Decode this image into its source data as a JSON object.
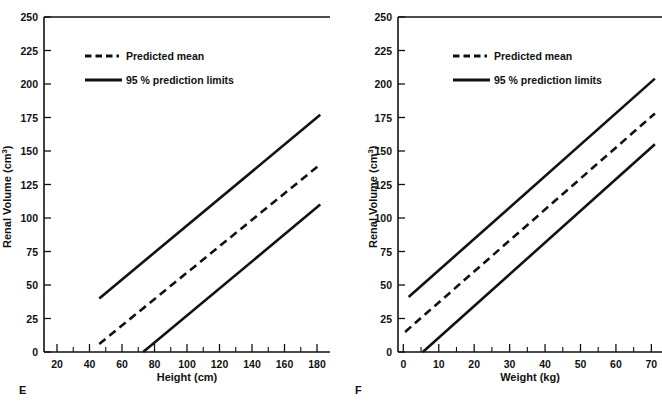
{
  "figure": {
    "background": "#ffffff",
    "ink_color": "#111111",
    "width": 662,
    "height": 415
  },
  "panels": [
    {
      "letter": "E",
      "letter_name": "panel-letter-e",
      "clipped_ylabel": true,
      "chart_data": {
        "type": "line",
        "title": "",
        "xlabel": "Height (cm)",
        "ylabel": "Renal Volume (cm",
        "ylabel_sup": "3",
        "ylabel_tail": ")",
        "xlim": [
          12,
          188
        ],
        "ylim": [
          0,
          250
        ],
        "xticks": [
          20,
          40,
          60,
          80,
          100,
          120,
          140,
          160,
          180
        ],
        "xtick_labels": [
          "20",
          "40",
          "60",
          "80",
          "100",
          "120",
          "140",
          "160",
          "180"
        ],
        "x_minor_step": 10,
        "yticks": [
          0,
          25,
          50,
          75,
          100,
          125,
          150,
          175,
          200,
          225,
          250
        ],
        "ytick_labels": [
          "0",
          "25",
          "50",
          "75",
          "100",
          "125",
          "150",
          "175",
          "200",
          "225",
          "250"
        ],
        "grid": false,
        "legend_position": "top-left",
        "series": [
          {
            "name": "95 % prediction limits upper",
            "style": "solid",
            "x": [
              46,
              182
            ],
            "y": [
              40,
              177
            ]
          },
          {
            "name": "Predicted mean",
            "style": "dashed",
            "x": [
              46,
              182
            ],
            "y": [
              6,
              140
            ]
          },
          {
            "name": "95 % prediction limits lower",
            "style": "solid",
            "x": [
              73,
              182
            ],
            "y": [
              0,
              110
            ]
          }
        ]
      }
    },
    {
      "letter": "F",
      "letter_name": "panel-letter-f",
      "clipped_ylabel": false,
      "chart_data": {
        "type": "line",
        "title": "",
        "xlabel": "Weight (kg)",
        "ylabel": "Renal Volume (cm",
        "ylabel_sup": "3",
        "ylabel_tail": ")",
        "xlim": [
          -1.5,
          73
        ],
        "ylim": [
          0,
          250
        ],
        "xticks": [
          0,
          10,
          20,
          30,
          40,
          50,
          60,
          70
        ],
        "xtick_labels": [
          "0",
          "10",
          "20",
          "30",
          "40",
          "50",
          "60",
          "70"
        ],
        "x_minor_step": 5,
        "yticks": [
          0,
          25,
          50,
          75,
          100,
          125,
          150,
          175,
          200,
          225,
          250
        ],
        "ytick_labels": [
          "0",
          "25",
          "50",
          "75",
          "100",
          "125",
          "150",
          "175",
          "200",
          "225",
          "250"
        ],
        "grid": false,
        "legend_position": "top-left",
        "series": [
          {
            "name": "95 % prediction limits upper",
            "style": "solid",
            "x": [
              1.5,
              71
            ],
            "y": [
              41,
              204
            ]
          },
          {
            "name": "Predicted mean",
            "style": "dashed",
            "x": [
              0.5,
              71
            ],
            "y": [
              15,
              178
            ]
          },
          {
            "name": "95 % prediction limits lower",
            "style": "solid",
            "x": [
              5.5,
              71
            ],
            "y": [
              0,
              155
            ]
          }
        ]
      }
    }
  ],
  "legend": {
    "entries": [
      {
        "label": "Predicted mean",
        "style": "dashed"
      },
      {
        "label": "95 % prediction limits",
        "style": "solid"
      }
    ]
  }
}
